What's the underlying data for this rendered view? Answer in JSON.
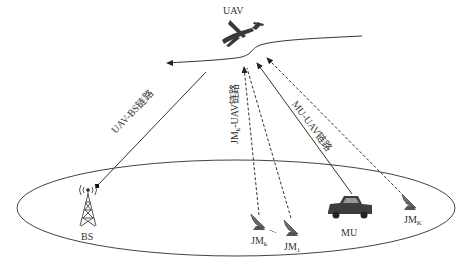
{
  "nodes": {
    "uav": {
      "label": "UAV"
    },
    "bs": {
      "label": "BS"
    },
    "mu": {
      "label": "MU"
    },
    "jm_k": {
      "label": "JM",
      "subscript": "k"
    },
    "jm_1": {
      "label": "JM",
      "subscript": "1"
    },
    "jm_K": {
      "label": "JM",
      "subscript": "K"
    },
    "ellipsis": "..."
  },
  "links": {
    "uav_bs": {
      "label": "UAV-BS链路",
      "style": "solid"
    },
    "jm_uav": {
      "label_prefix": "JM",
      "label_sub": "k",
      "label_suffix": "-UAV链路",
      "style": "dashed"
    },
    "mu_uav": {
      "label": "MU-UAV链路",
      "style": "solid"
    }
  },
  "colors": {
    "line": "#333333",
    "icon": "#555555",
    "background": "#ffffff"
  }
}
